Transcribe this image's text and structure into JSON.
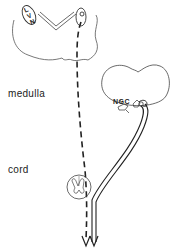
{
  "diagram": {
    "labels": {
      "lvn": "LVN",
      "lvn_l": "L",
      "lvn_v": "V",
      "lvn_n": "N",
      "medulla": "medulla",
      "cord": "cord",
      "ngc": "NGC"
    },
    "pathways": [
      {
        "name": "vestibulospinal",
        "from": "LVN",
        "to": "cord",
        "style": "dashed"
      },
      {
        "name": "reticulospinal",
        "from": "NGC",
        "to": "cord",
        "style": "double-line"
      }
    ],
    "colors": {
      "line": "#333333",
      "background": "#ffffff"
    }
  }
}
